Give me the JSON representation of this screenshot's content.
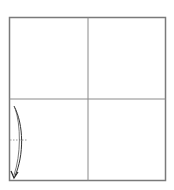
{
  "diagram": {
    "title": "",
    "grid": {
      "rows": 2,
      "cols": 2
    },
    "colors": {
      "frame": "#7a7a7a",
      "divider": "#8a8a8a",
      "stroke": "#333333",
      "dotted": "#9a9a9a",
      "background": "#ffffff"
    },
    "annotations": [
      {
        "type": "curved-arrow",
        "quadrant": "bottom-left",
        "direction": "down"
      },
      {
        "type": "dotted-line",
        "quadrant": "bottom-left",
        "orientation": "horizontal"
      }
    ]
  }
}
